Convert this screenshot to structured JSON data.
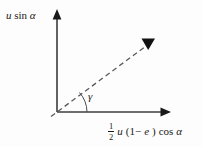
{
  "figure": {
    "background_color": "#fdfdfd",
    "line_color": "#3c3c3c",
    "text_color": "#1a1a1a"
  },
  "axes": {
    "y_axis": {
      "label_parts": {
        "u": "u",
        "sin": "sin",
        "alpha": "α"
      },
      "label_text": "u sin α",
      "origin": {
        "x": 57,
        "y": 112
      },
      "tip": {
        "x": 57,
        "y": 12
      }
    },
    "x_axis": {
      "label_parts": {
        "numerator": "1",
        "denominator": "2",
        "u": "u",
        "open_paren": "(1−",
        "e": "e",
        "close_paren": ")",
        "cos": "cos",
        "alpha": "α"
      },
      "label_text": "½ u (1−e) cos α",
      "origin": {
        "x": 57,
        "y": 112
      },
      "tip": {
        "x": 170,
        "y": 112
      }
    }
  },
  "vector": {
    "style": "dashed",
    "start": {
      "x": 51,
      "y": 116
    },
    "end": {
      "x": 148,
      "y": 44
    },
    "arrowhead": "filled-triangle"
  },
  "angle": {
    "symbol": "γ",
    "label_text": "γ",
    "arc_radius": 30
  }
}
